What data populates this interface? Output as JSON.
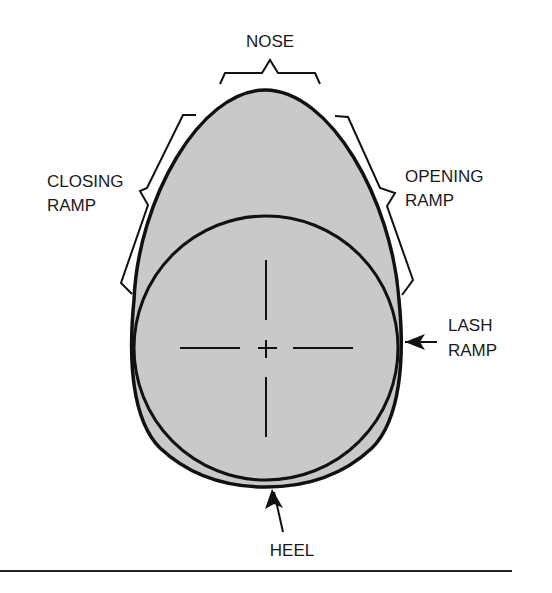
{
  "diagram": {
    "colors": {
      "lobe_fill": "#c9c9c9",
      "outline": "#111111",
      "background": "#ffffff"
    },
    "labels": {
      "nose": "NOSE",
      "closing_ramp": [
        "CLOSING",
        "RAMP"
      ],
      "opening_ramp": [
        "OPENING",
        "RAMP"
      ],
      "lash_ramp": [
        "LASH",
        "RAMP"
      ],
      "heel": "HEEL"
    },
    "elements": {
      "base_circle": "base-circle",
      "centerline_crosshair": "center-mark",
      "nose_bracket": "brace",
      "closing_ramp_bracket": "brace",
      "opening_ramp_bracket": "brace",
      "lash_ramp_arrow": "arrow",
      "heel_arrow": "arrow"
    }
  }
}
